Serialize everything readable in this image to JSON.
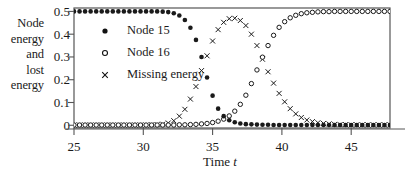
{
  "chart_data": {
    "type": "scatter",
    "title": "",
    "xlabel": "Time t",
    "ylabel": "Node energy and lost energy",
    "ylabel_lines": [
      "Node",
      "energy",
      "and",
      "lost",
      "energy"
    ],
    "xlim": [
      25,
      47.8
    ],
    "ylim": [
      -0.012,
      0.515
    ],
    "grid": false,
    "legend_position": "upper-left-inside",
    "xticks": [
      25,
      30,
      35,
      40,
      45
    ],
    "xtick_labels": [
      "25",
      "30",
      "35",
      "40",
      "45"
    ],
    "yticks": [
      0,
      0.1,
      0.2,
      0.3,
      0.4,
      0.5
    ],
    "ytick_labels": [
      "0",
      "0.1",
      "0.2",
      "0.3",
      "0.4",
      "0.5"
    ],
    "marker_styles": {
      "Node 15": "filled-circle",
      "Node 16": "open-circle",
      "Missing energy": "cross"
    },
    "series": [
      {
        "name": "Node 15",
        "marker": "filled-circle",
        "x": [
          25,
          25.4,
          25.8,
          26.2,
          26.6,
          27,
          27.4,
          27.8,
          28.2,
          28.6,
          29,
          29.4,
          29.8,
          30.2,
          30.6,
          31,
          31.4,
          31.8,
          32.2,
          32.6,
          33,
          33.4,
          33.8,
          34.2,
          34.6,
          35,
          35.4,
          35.8,
          36.2,
          36.6,
          37,
          37.4,
          37.8,
          38.2,
          38.6,
          39,
          39.4,
          39.8,
          40.2,
          40.6,
          41,
          41.4,
          41.8,
          42.2,
          42.6,
          43,
          43.4,
          43.8,
          44.2,
          44.6,
          45,
          45.4,
          45.8,
          46.2,
          46.6,
          47,
          47.4,
          47.8
        ],
        "y": [
          0.5,
          0.5,
          0.5,
          0.5,
          0.5,
          0.5,
          0.5,
          0.5,
          0.5,
          0.5,
          0.5,
          0.5,
          0.5,
          0.5,
          0.5,
          0.5,
          0.499,
          0.497,
          0.492,
          0.482,
          0.462,
          0.428,
          0.375,
          0.3,
          0.21,
          0.13,
          0.073,
          0.04,
          0.022,
          0.013,
          0.008,
          0.005,
          0.004,
          0.003,
          0.002,
          0.002,
          0.001,
          0.001,
          0.001,
          0.001,
          0.001,
          0.001,
          0.001,
          0.001,
          0.001,
          0.001,
          0.001,
          0.001,
          0.001,
          0.001,
          0.001,
          0.001,
          0.001,
          0.001,
          0.001,
          0.001,
          0.001,
          0.001
        ]
      },
      {
        "name": "Node 16",
        "marker": "open-circle",
        "x": [
          25,
          25.4,
          25.8,
          26.2,
          26.6,
          27,
          27.4,
          27.8,
          28.2,
          28.6,
          29,
          29.4,
          29.8,
          30.2,
          30.6,
          31,
          31.4,
          31.8,
          32.2,
          32.6,
          33,
          33.4,
          33.8,
          34.2,
          34.6,
          35,
          35.4,
          35.8,
          36.2,
          36.6,
          37,
          37.4,
          37.8,
          38.2,
          38.6,
          39,
          39.4,
          39.8,
          40.2,
          40.6,
          41,
          41.4,
          41.8,
          42.2,
          42.6,
          43,
          43.4,
          43.8,
          44.2,
          44.6,
          45,
          45.4,
          45.8,
          46.2,
          46.6,
          47,
          47.4,
          47.8
        ],
        "y": [
          0.001,
          0.001,
          0.001,
          0.001,
          0.001,
          0.001,
          0.001,
          0.001,
          0.001,
          0.001,
          0.001,
          0.001,
          0.001,
          0.001,
          0.001,
          0.001,
          0.001,
          0.001,
          0.001,
          0.002,
          0.002,
          0.003,
          0.004,
          0.006,
          0.008,
          0.012,
          0.018,
          0.027,
          0.041,
          0.062,
          0.092,
          0.132,
          0.183,
          0.243,
          0.299,
          0.35,
          0.395,
          0.43,
          0.455,
          0.472,
          0.483,
          0.49,
          0.494,
          0.496,
          0.498,
          0.499,
          0.499,
          0.5,
          0.5,
          0.5,
          0.5,
          0.5,
          0.5,
          0.5,
          0.5,
          0.5,
          0.5,
          0.5
        ]
      },
      {
        "name": "Missing energy",
        "marker": "cross",
        "x": [
          25,
          25.4,
          25.8,
          26.2,
          26.6,
          27,
          27.4,
          27.8,
          28.2,
          28.6,
          29,
          29.4,
          29.8,
          30.2,
          30.6,
          31,
          31.4,
          31.8,
          32.2,
          32.6,
          33,
          33.4,
          33.8,
          34.2,
          34.6,
          35,
          35.4,
          35.8,
          36.2,
          36.6,
          37,
          37.4,
          37.8,
          38.2,
          38.6,
          39,
          39.4,
          39.8,
          40.2,
          40.6,
          41,
          41.4,
          41.8,
          42.2,
          42.6,
          43,
          43.4,
          43.8,
          44.2,
          44.6,
          45,
          45.4,
          45.8,
          46.2,
          46.6,
          47,
          47.4,
          47.8
        ],
        "y": [
          0.001,
          0.001,
          0.001,
          0.001,
          0.001,
          0.001,
          0.001,
          0.001,
          0.001,
          0.001,
          0.001,
          0.001,
          0.001,
          0.001,
          0.002,
          0.003,
          0.005,
          0.01,
          0.02,
          0.04,
          0.07,
          0.115,
          0.17,
          0.24,
          0.305,
          0.37,
          0.42,
          0.452,
          0.468,
          0.47,
          0.46,
          0.438,
          0.4,
          0.35,
          0.29,
          0.235,
          0.185,
          0.14,
          0.103,
          0.073,
          0.05,
          0.034,
          0.023,
          0.016,
          0.011,
          0.008,
          0.006,
          0.004,
          0.003,
          0.003,
          0.002,
          0.002,
          0.002,
          0.002,
          0.002,
          0.002,
          0.002,
          0.002
        ]
      }
    ]
  },
  "axes": {
    "ylabel_lines": [
      "Node",
      "energy",
      "and",
      "lost",
      "energy"
    ],
    "xlabel_prefix": "Time ",
    "xlabel_variable": "t"
  },
  "legend": {
    "items": [
      {
        "label": "Node 15",
        "marker": "filled-circle"
      },
      {
        "label": "Node 16",
        "marker": "open-circle"
      },
      {
        "label": "Missing energy",
        "marker": "cross"
      }
    ]
  },
  "colors": {
    "ink": "#1a1a1a",
    "frame": "#555555",
    "background": "#ffffff"
  }
}
